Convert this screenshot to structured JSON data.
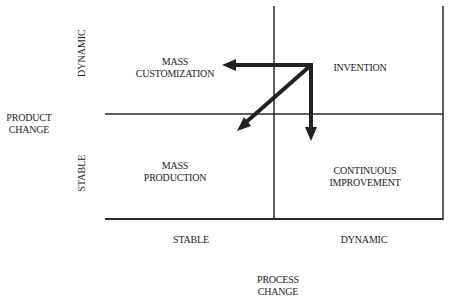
{
  "diagram": {
    "type": "2x2 matrix",
    "axes": {
      "y_title": [
        "PRODUCT",
        "CHANGE"
      ],
      "y_ticks": {
        "top": "DYNAMIC",
        "bottom": "STABLE"
      },
      "x_title": [
        "PROCESS",
        "CHANGE"
      ],
      "x_ticks": {
        "left": "STABLE",
        "right": "DYNAMIC"
      }
    },
    "quadrants": {
      "top_left": [
        "MASS",
        "CUSTOMIZATION"
      ],
      "top_right": [
        "INVENTION"
      ],
      "bottom_left": [
        "MASS",
        "PRODUCTION"
      ],
      "bottom_right": [
        "CONTINUOUS",
        "IMPROVEMENT"
      ]
    },
    "arrows": [
      {
        "from": "INVENTION",
        "to": "MASS CUSTOMIZATION",
        "direction": "left"
      },
      {
        "from": "INVENTION",
        "to": "CONTINUOUS IMPROVEMENT",
        "direction": "down"
      },
      {
        "from": "INVENTION",
        "to": "MASS PRODUCTION",
        "direction": "diagonal down-left"
      }
    ],
    "line_color": "#2a2a2a"
  }
}
